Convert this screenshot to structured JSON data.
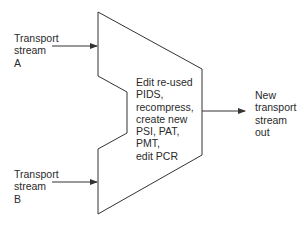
{
  "diagram": {
    "inputs": [
      {
        "id": "A",
        "lines": [
          "Transport",
          "stream",
          "A"
        ]
      },
      {
        "id": "B",
        "lines": [
          "Transport",
          "stream",
          "B"
        ]
      }
    ],
    "process": {
      "lines": [
        "Edit re-used",
        "PIDS,",
        "recompress,",
        "create new",
        "PSI, PAT,",
        "PMT,",
        "edit PCR"
      ]
    },
    "output": {
      "lines": [
        "New",
        "transport",
        "stream",
        "out"
      ]
    },
    "colors": {
      "stroke": "#333333",
      "text": "#2a2a2a",
      "background": "#ffffff"
    }
  }
}
